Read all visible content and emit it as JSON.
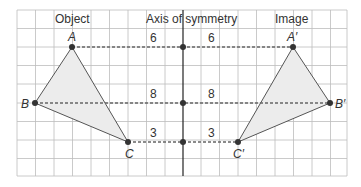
{
  "headers": {
    "object": "Object",
    "axis": "Axis of symmetry",
    "image": "Image"
  },
  "points": {
    "A": {
      "label": "A"
    },
    "B": {
      "label": "B"
    },
    "C": {
      "label": "C"
    },
    "A_prime": {
      "label": "A′"
    },
    "B_prime": {
      "label": "B′"
    },
    "C_prime": {
      "label": "C′"
    }
  },
  "distances": {
    "A_left": "6",
    "A_right": "6",
    "B_left": "8",
    "B_right": "8",
    "C_left": "3",
    "C_right": "3"
  },
  "colors": {
    "grid": "#b8b8b8",
    "triangle_fill": "#ededed",
    "line": "#555555",
    "point": "#333333"
  }
}
